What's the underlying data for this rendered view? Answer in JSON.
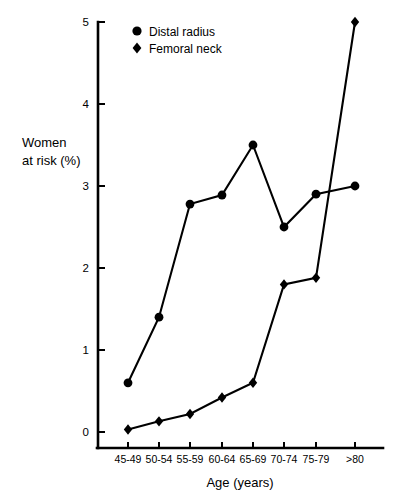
{
  "chart_data": {
    "type": "line",
    "title": "",
    "subtitle": "",
    "xlabel": "Age (years)",
    "ylabel": "Women at risk (%)",
    "categories": [
      "45-49",
      "50-54",
      "55-59",
      "60-64",
      "65-69",
      "70-74",
      "75-79",
      ">80"
    ],
    "ylim": [
      0,
      5
    ],
    "yticks": [
      "0",
      "1",
      "2",
      "3",
      "4",
      "5"
    ],
    "ytick_values": [
      0,
      1,
      2,
      3,
      4,
      5
    ],
    "grid": false,
    "legend_position": "top-center",
    "series": [
      {
        "name": "Distal radius",
        "marker": "circle",
        "color": "#000000",
        "values": [
          0.6,
          1.4,
          2.78,
          2.89,
          3.5,
          2.5,
          2.9,
          3.0
        ]
      },
      {
        "name": "Femoral neck",
        "marker": "diamond",
        "color": "#000000",
        "values": [
          0.03,
          0.13,
          0.22,
          0.42,
          0.6,
          1.8,
          1.88,
          5.0
        ]
      }
    ]
  },
  "axis": {
    "y_label_line1": "Women",
    "y_label_line2": "at risk (%)",
    "x_title": "Age (years)"
  },
  "legend": {
    "items": [
      {
        "label": "Distal radius",
        "marker": "circle-marker-icon"
      },
      {
        "label": "Femoral neck",
        "marker": "diamond-marker-icon"
      }
    ]
  }
}
